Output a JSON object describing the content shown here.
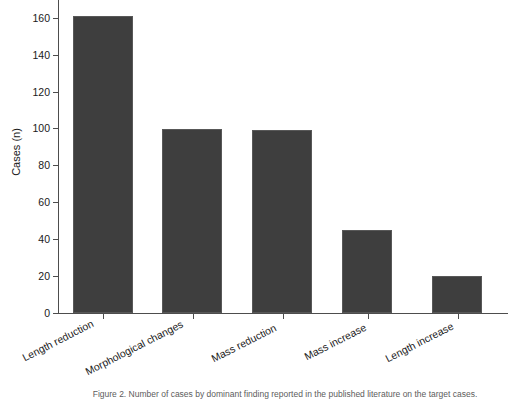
{
  "chart_data": {
    "type": "bar",
    "title": "",
    "categories": [
      "Length reduction",
      "Morphological changes",
      "Mass reduction",
      "Mass increase",
      "Length increase"
    ],
    "values": [
      161,
      100,
      99,
      45,
      20
    ],
    "xlabel": "",
    "ylabel": "Cases (n)",
    "ylim": [
      0,
      168
    ],
    "yticks": [
      0,
      20,
      40,
      60,
      80,
      100,
      120,
      140,
      160
    ],
    "ytick_labels": [
      "0",
      "20",
      "40",
      "60",
      "80",
      "100",
      "120",
      "140",
      "160"
    ],
    "grid": false,
    "legend": false,
    "bar_color": "#3e3e3e",
    "axis_color": "#4d4d4d",
    "background": "#ffffff",
    "xtick_label_rotation_deg": -27
  },
  "caption": {
    "text": "Figure 2. Number of cases by dominant finding reported in the published literature on the target cases."
  }
}
